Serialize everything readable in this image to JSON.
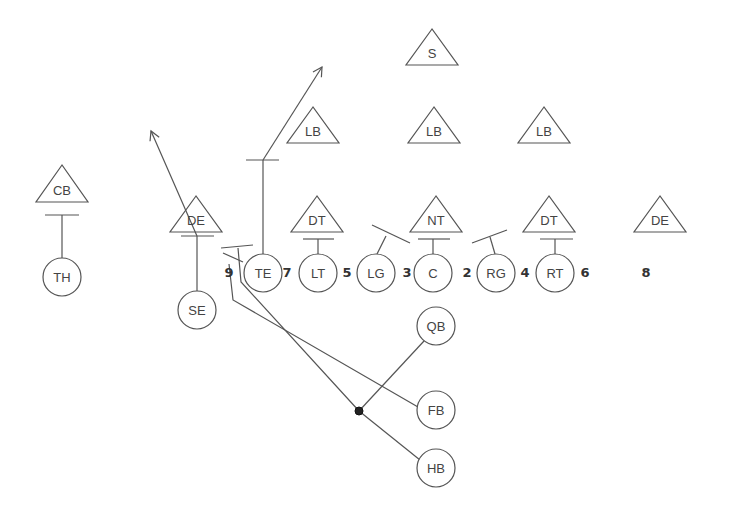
{
  "diagram": {
    "title": "",
    "colors": {
      "line": "#555555",
      "text": "#444444",
      "ball": "#222222"
    },
    "defense": [
      {
        "id": "s",
        "label": "S",
        "x": 432,
        "apex": 29,
        "base": 65
      },
      {
        "id": "lb1",
        "label": "LB",
        "x": 313,
        "apex": 107,
        "base": 143
      },
      {
        "id": "lb2",
        "label": "LB",
        "x": 434,
        "apex": 107,
        "base": 143
      },
      {
        "id": "lb3",
        "label": "LB",
        "x": 544,
        "apex": 107,
        "base": 143
      },
      {
        "id": "cb",
        "label": "CB",
        "x": 62,
        "apex": 165,
        "base": 202
      },
      {
        "id": "de1",
        "label": "DE",
        "x": 196,
        "apex": 196,
        "base": 232
      },
      {
        "id": "dt1",
        "label": "DT",
        "x": 317,
        "apex": 196,
        "base": 232
      },
      {
        "id": "nt",
        "label": "NT",
        "x": 436,
        "apex": 196,
        "base": 232
      },
      {
        "id": "dt2",
        "label": "DT",
        "x": 549,
        "apex": 196,
        "base": 232
      },
      {
        "id": "de2",
        "label": "DE",
        "x": 660,
        "apex": 196,
        "base": 232
      }
    ],
    "offense": [
      {
        "id": "th",
        "label": "TH",
        "x": 62,
        "y": 277
      },
      {
        "id": "se",
        "label": "SE",
        "x": 197,
        "y": 310
      },
      {
        "id": "te",
        "label": "TE",
        "x": 263,
        "y": 273
      },
      {
        "id": "lt",
        "label": "LT",
        "x": 318,
        "y": 273
      },
      {
        "id": "lg",
        "label": "LG",
        "x": 376,
        "y": 273
      },
      {
        "id": "c",
        "label": "C",
        "x": 433,
        "y": 273
      },
      {
        "id": "rg",
        "label": "RG",
        "x": 496,
        "y": 273
      },
      {
        "id": "rt",
        "label": "RT",
        "x": 555,
        "y": 273
      },
      {
        "id": "qb",
        "label": "QB",
        "x": 436,
        "y": 326
      },
      {
        "id": "fb",
        "label": "FB",
        "x": 436,
        "y": 410
      },
      {
        "id": "hb",
        "label": "HB",
        "x": 436,
        "y": 468
      }
    ],
    "gap_numbers": [
      {
        "label": "9",
        "x": 229,
        "y": 272
      },
      {
        "label": "7",
        "x": 287,
        "y": 272
      },
      {
        "label": "5",
        "x": 347,
        "y": 272
      },
      {
        "label": "3",
        "x": 407,
        "y": 272
      },
      {
        "label": "2",
        "x": 467,
        "y": 272
      },
      {
        "label": "4",
        "x": 525,
        "y": 272
      },
      {
        "label": "6",
        "x": 585,
        "y": 272
      },
      {
        "label": "8",
        "x": 646,
        "y": 272
      }
    ],
    "ball": {
      "x": 359,
      "y": 411
    },
    "circle_radius": 19
  }
}
